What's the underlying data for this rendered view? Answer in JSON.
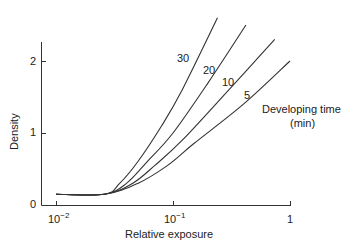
{
  "chart_data": {
    "type": "line",
    "title": "",
    "xlabel": "Relative exposure",
    "ylabel": "Density",
    "xscale": "log",
    "xlim": [
      0.008,
      1
    ],
    "ylim": [
      0,
      2.3
    ],
    "x_ticks": [
      {
        "value": 0.01,
        "base": "10",
        "exp": "−2"
      },
      {
        "value": 0.1,
        "base": "10",
        "exp": "−1"
      },
      {
        "value": 1,
        "base": "1",
        "exp": ""
      }
    ],
    "y_ticks": [
      "0",
      "1",
      "2"
    ],
    "legend_title": "Developing time",
    "legend_unit": "(min)",
    "base_fog_density": 0.15,
    "series": [
      {
        "name": "30",
        "x": [
          0.01,
          0.026,
          0.035,
          0.05,
          0.08,
          0.12,
          0.24
        ],
        "y": [
          0.15,
          0.15,
          0.3,
          0.6,
          1.1,
          1.6,
          2.6
        ]
      },
      {
        "name": "20",
        "x": [
          0.01,
          0.026,
          0.04,
          0.06,
          0.1,
          0.2,
          0.42
        ],
        "y": [
          0.15,
          0.15,
          0.3,
          0.6,
          1.0,
          1.7,
          2.5
        ]
      },
      {
        "name": "10",
        "x": [
          0.01,
          0.026,
          0.045,
          0.07,
          0.12,
          0.3,
          0.74
        ],
        "y": [
          0.15,
          0.15,
          0.3,
          0.55,
          0.9,
          1.6,
          2.3
        ]
      },
      {
        "name": "5",
        "x": [
          0.01,
          0.026,
          0.05,
          0.09,
          0.15,
          0.4,
          1.0
        ],
        "y": [
          0.15,
          0.15,
          0.3,
          0.55,
          0.85,
          1.4,
          2.0
        ]
      }
    ]
  }
}
